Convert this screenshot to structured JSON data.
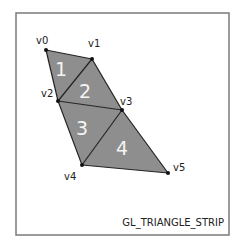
{
  "diagram": {
    "caption": "GL_TRIANGLE_STRIP",
    "colors": {
      "frame": "#7a7a7a",
      "fill": "#8e8e8e",
      "edge": "#222222",
      "vertex": "#111111",
      "number": "#f4f4f4",
      "label": "#222222"
    },
    "frame": {
      "x": 16,
      "y": 13,
      "w": 213,
      "h": 222
    },
    "vertices": [
      {
        "id": "v0",
        "label": "v0",
        "x": 46,
        "y": 50,
        "lx": 36,
        "ly": 44
      },
      {
        "id": "v1",
        "label": "v1",
        "x": 92,
        "y": 59,
        "lx": 88,
        "ly": 47
      },
      {
        "id": "v2",
        "label": "v2",
        "x": 58,
        "y": 101,
        "lx": 41,
        "ly": 97
      },
      {
        "id": "v3",
        "label": "v3",
        "x": 122,
        "y": 110,
        "lx": 120,
        "ly": 105
      },
      {
        "id": "v4",
        "label": "v4",
        "x": 82,
        "y": 165,
        "lx": 64,
        "ly": 180
      },
      {
        "id": "v5",
        "label": "v5",
        "x": 168,
        "y": 173,
        "lx": 173,
        "ly": 171
      }
    ],
    "triangles": [
      {
        "label": "1",
        "verts": [
          0,
          1,
          2
        ],
        "tx": 55,
        "ty": 76
      },
      {
        "label": "2",
        "verts": [
          1,
          2,
          3
        ],
        "tx": 79,
        "ty": 98
      },
      {
        "label": "3",
        "verts": [
          2,
          3,
          4
        ],
        "tx": 76,
        "ty": 135
      },
      {
        "label": "4",
        "verts": [
          3,
          4,
          5
        ],
        "tx": 116,
        "ty": 155
      }
    ]
  }
}
